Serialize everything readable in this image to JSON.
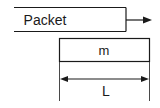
{
  "diagram": {
    "packet_label": "Packet",
    "segment_label": "m",
    "length_label": "L",
    "stroke_color": "#1a1a1a"
  }
}
